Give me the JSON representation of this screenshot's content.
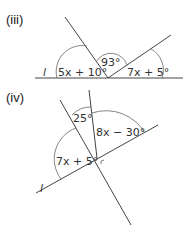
{
  "figures": [
    {
      "id": "iii",
      "label": "(iii)",
      "line_label": "l",
      "angles": [
        {
          "name": "left",
          "text": "5x + 10°"
        },
        {
          "name": "middle",
          "text": "93°"
        },
        {
          "name": "right",
          "text": "7x + 5°"
        }
      ]
    },
    {
      "id": "iv",
      "label": "(iv)",
      "line_label": "l",
      "angles": [
        {
          "name": "top",
          "text": "25°"
        },
        {
          "name": "upper-right",
          "text": "8x − 30°"
        },
        {
          "name": "left",
          "text": "7x + 5°"
        }
      ]
    }
  ]
}
